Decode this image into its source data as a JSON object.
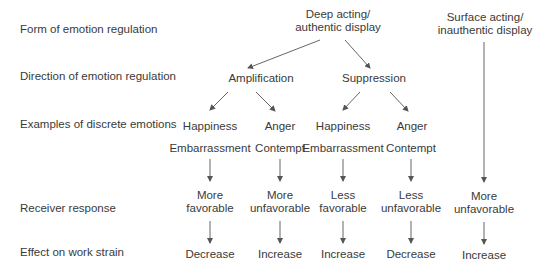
{
  "row_labels": {
    "form": "Form of emotion regulation",
    "direction": "Direction of emotion regulation",
    "examples": "Examples of discrete emotions",
    "receiver": "Receiver response",
    "effect": "Effect on work strain"
  },
  "forms": {
    "deep": {
      "line1": "Deep acting/",
      "line2": "authentic display"
    },
    "surface": {
      "line1": "Surface acting/",
      "line2": "inauthentic display"
    }
  },
  "directions": {
    "amplification": "Amplification",
    "suppression": "Suppression"
  },
  "branches": [
    {
      "emotion1": "Happiness",
      "emotion2": "Embarrassment",
      "response1": "More",
      "response2": "favorable",
      "effect": "Decrease"
    },
    {
      "emotion1": "Anger",
      "emotion2": "Contempt",
      "response1": "More",
      "response2": "unfavorable",
      "effect": "Increase"
    },
    {
      "emotion1": "Happiness",
      "emotion2": "Embarrassment",
      "response1": "Less",
      "response2": "favorable",
      "effect": "Increase"
    },
    {
      "emotion1": "Anger",
      "emotion2": "Contempt",
      "response1": "Less",
      "response2": "unfavorable",
      "effect": "Decrease"
    }
  ],
  "surface_branch": {
    "response1": "More",
    "response2": "unfavorable",
    "effect": "Increase"
  },
  "colors": {
    "text": "#3a3a3a",
    "arrow": "#555555",
    "background": "#ffffff"
  }
}
